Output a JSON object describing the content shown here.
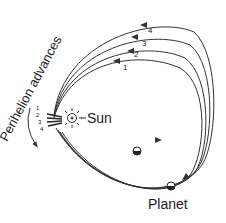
{
  "diagram": {
    "curved_label": "Perihelion advances",
    "sun_label": "Sun",
    "planet_label": "Planet",
    "orbit_labels": [
      "1",
      "2",
      "3",
      "4"
    ],
    "perihelion_labels": [
      "1",
      "2",
      "3",
      "4"
    ],
    "colors": {
      "line": "#333333",
      "background": "#ffffff"
    }
  }
}
